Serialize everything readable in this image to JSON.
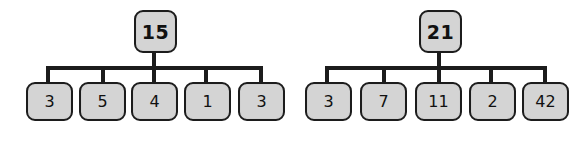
{
  "diagram": {
    "type": "node-link-tree",
    "node_fill_color": "#d4d4d4",
    "node_border_color": "#1c1c1c",
    "connector_color": "#1c1c1c",
    "background_color": "#ffffff"
  },
  "trees": [
    {
      "id": "tree-left",
      "root": {
        "label": "15"
      },
      "children": [
        {
          "label": "3"
        },
        {
          "label": "5"
        },
        {
          "label": "4"
        },
        {
          "label": "1"
        },
        {
          "label": "3"
        }
      ]
    },
    {
      "id": "tree-right",
      "root": {
        "label": "21"
      },
      "children": [
        {
          "label": "3"
        },
        {
          "label": "7"
        },
        {
          "label": "11"
        },
        {
          "label": "2"
        },
        {
          "label": "42"
        }
      ]
    }
  ]
}
